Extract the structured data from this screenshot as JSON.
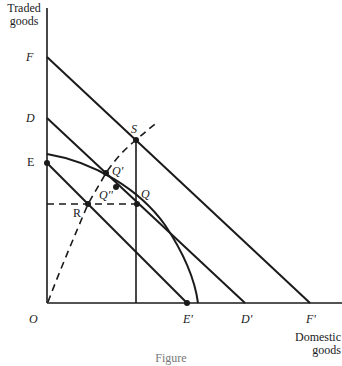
{
  "diagram": {
    "axes": {
      "y_title_line1": "Traded",
      "y_title_line2": "goods",
      "x_title_line1": "Domestic",
      "x_title_line2": "goods",
      "origin_label": "O"
    },
    "y_axis_labels": {
      "F": "F",
      "D": "D",
      "E": "E"
    },
    "x_axis_labels": {
      "E_prime": "E'",
      "D_prime": "D'",
      "F_prime": "F'"
    },
    "points": {
      "S": "S",
      "Q": "Q",
      "Q_prime": "Q'",
      "Q_double_prime": "Q''",
      "R": "R"
    },
    "elements": [
      {
        "name": "budget-line-FF'",
        "from": "F",
        "to": "F'",
        "style": "solid"
      },
      {
        "name": "budget-line-DD'",
        "from": "D",
        "to": "D'",
        "style": "solid"
      },
      {
        "name": "budget-line-EE'",
        "from": "E",
        "to": "E'",
        "style": "solid"
      },
      {
        "name": "production-possibility-curve",
        "style": "solid concave"
      },
      {
        "name": "expansion-path",
        "from": "O",
        "through": [
          "R",
          "Q''",
          "Q'",
          "S"
        ],
        "style": "dashed"
      },
      {
        "name": "vertical-line-S-Q",
        "style": "solid"
      },
      {
        "name": "horizontal-line-R-Q",
        "style": "dashed"
      }
    ],
    "caption": "Figure"
  }
}
